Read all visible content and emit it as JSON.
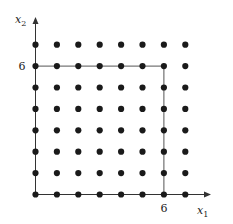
{
  "diagram": {
    "x_axis_label": "x",
    "x_axis_sub": "1",
    "y_axis_label": "x",
    "y_axis_sub": "2",
    "x_tick_label": "6",
    "y_tick_label": "6",
    "lattice": {
      "x_range": [
        0,
        7
      ],
      "y_range": [
        0,
        7
      ]
    },
    "square_bound": 6,
    "colors": {
      "dot": "#1a1a1a",
      "line": "#555555",
      "axis": "#333333"
    }
  }
}
